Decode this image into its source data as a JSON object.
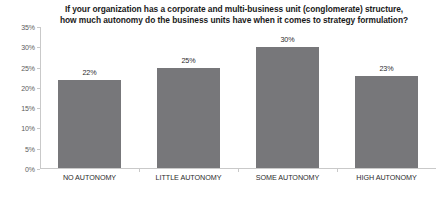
{
  "chart_data": {
    "type": "bar",
    "title": "If your organization has a corporate and multi-business unit (conglomerate) structure, how much autonomy do the business units have when it comes to strategy formulation?",
    "title_lines": [
      "If your organization has a corporate and multi-business unit (conglomerate) structure,",
      "how much autonomy do the business units have when it comes to strategy formulation?"
    ],
    "categories": [
      "NO AUTONOMY",
      "LITTLE AUTONOMY",
      "SOME AUTONOMY",
      "HIGH AUTONOMY"
    ],
    "values": [
      22,
      25,
      30,
      23
    ],
    "value_labels": [
      "22%",
      "25%",
      "30%",
      "23%"
    ],
    "xlabel": "",
    "ylabel": "",
    "ylim": [
      0,
      35
    ],
    "ytick_values": [
      0,
      5,
      10,
      15,
      20,
      25,
      30,
      35
    ],
    "ytick_labels": [
      "0%",
      "5%",
      "10%",
      "15%",
      "20%",
      "25%",
      "30%",
      "35%"
    ],
    "grid": false,
    "legend": false,
    "bar_color": "#77777a",
    "axis_color": "#c9c9c9",
    "title_color": "#1b1b1b",
    "label_color": "#2b2b2b",
    "tick_label_color": "#5d5d5d",
    "background_color": "#ffffff"
  }
}
